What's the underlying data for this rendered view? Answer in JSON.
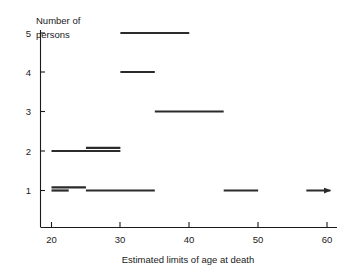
{
  "chart_data": {
    "type": "bar",
    "title": "",
    "subtitle": "",
    "ylabel_lines": [
      "Number of",
      "persons"
    ],
    "xlabel": "Estimated limits of age at death",
    "xlim": [
      17.5,
      61.5
    ],
    "ylim": [
      0.3,
      5.4
    ],
    "xticks": [
      20,
      30,
      40,
      50,
      60
    ],
    "xtick_labels": [
      "20",
      "30",
      "40",
      "50",
      "60"
    ],
    "yticks": [
      1,
      2,
      3,
      4,
      5
    ],
    "ytick_labels": [
      "1",
      "2",
      "3",
      "4",
      "5"
    ],
    "grid": false,
    "legend": null,
    "orientation": "horizontal-range-bars",
    "note": "Each horizontal segment spans the estimated min-max age at death for a count level",
    "segments": [
      {
        "level": 5,
        "x_start": 30,
        "x_end": 40,
        "offset": 0,
        "open_ended": false
      },
      {
        "level": 4,
        "x_start": 30,
        "x_end": 35,
        "offset": 0,
        "open_ended": false
      },
      {
        "level": 3,
        "x_start": 35,
        "x_end": 45,
        "offset": 0,
        "open_ended": false
      },
      {
        "level": 2,
        "x_start": 20,
        "x_end": 30,
        "offset": 0,
        "open_ended": false
      },
      {
        "level": 2,
        "x_start": 25,
        "x_end": 30,
        "offset": 1,
        "open_ended": false
      },
      {
        "level": 1,
        "x_start": 25,
        "x_end": 35,
        "offset": 0,
        "open_ended": false
      },
      {
        "level": 1,
        "x_start": 20,
        "x_end": 25,
        "offset": 1,
        "open_ended": false
      },
      {
        "level": 1,
        "x_start": 20,
        "x_end": 22.5,
        "offset": 0,
        "open_ended": false
      },
      {
        "level": 1,
        "x_start": 45,
        "x_end": 50,
        "offset": 0,
        "open_ended": false
      },
      {
        "level": 1,
        "x_start": 57,
        "x_end": 60.5,
        "offset": 0,
        "open_ended": true
      }
    ],
    "colors": {
      "axis": "#1a1a1a",
      "segment": "#2b2b2b",
      "background": "#ffffff"
    }
  }
}
